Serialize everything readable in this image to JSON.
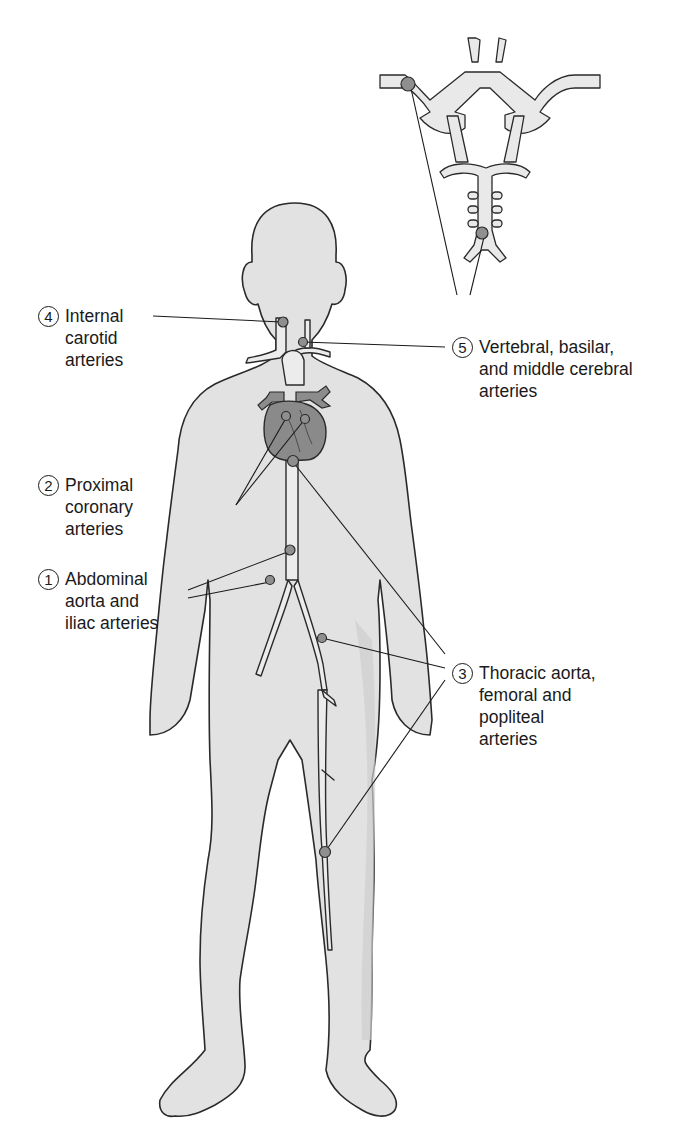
{
  "figure": {
    "colors": {
      "body_fill": "#e2e2e2",
      "body_shadow": "#cfcfcf",
      "outline": "#2a2a2a",
      "vessel_fill": "#e9e9e9",
      "heart_fill": "#8a8a8a",
      "lesion_marker": "#8f8f8f",
      "text": "#1a1a1a",
      "background": "#ffffff"
    }
  },
  "labels": [
    {
      "id": "internal-carotid",
      "number": "4",
      "lines": [
        "Internal",
        "carotid",
        "arteries"
      ]
    },
    {
      "id": "vertebral-basilar-mcA",
      "number": "5",
      "lines": [
        "Vertebral, basilar,",
        "and middle cerebral",
        "arteries"
      ]
    },
    {
      "id": "proximal-coronary",
      "number": "2",
      "lines": [
        "Proximal",
        "coronary",
        "arteries"
      ]
    },
    {
      "id": "abdominal-aorta-iliac",
      "number": "1",
      "lines": [
        "Abdominal",
        "aorta and",
        "iliac arteries"
      ]
    },
    {
      "id": "thoracic-femoral-popliteal",
      "number": "3",
      "lines": [
        "Thoracic aorta,",
        "femoral and",
        "popliteal",
        "arteries"
      ]
    }
  ],
  "icons": {
    "body": "human-body-silhouette",
    "brain_vessels": "circle-of-willis-diagram",
    "heart": "heart-illustration",
    "lesion": "lesion-marker-dot"
  }
}
